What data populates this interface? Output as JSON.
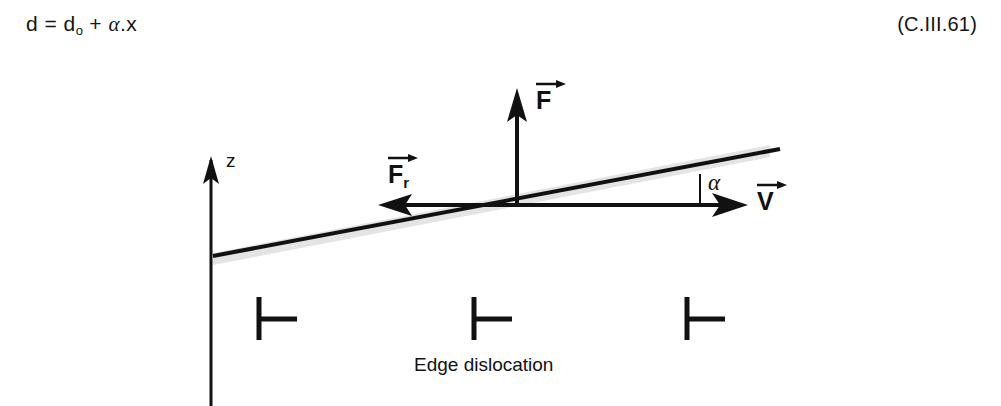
{
  "equation": {
    "text_main": "d = d",
    "subscript": "o",
    "text_after_sub": " + ",
    "alpha_symbol": "α",
    "text_tail": ".x",
    "number": "(C.III.61)"
  },
  "figure": {
    "axis": {
      "z_label": "z"
    },
    "vectors": [
      {
        "name": "force",
        "label": "F",
        "subscript": "",
        "direction": "up"
      },
      {
        "name": "friction-force",
        "label": "F",
        "subscript": "r",
        "direction": "left"
      },
      {
        "name": "velocity",
        "label": "V",
        "subscript": "",
        "direction": "right"
      }
    ],
    "angle": {
      "label": "α"
    },
    "caption": "Edge dislocation",
    "dislocation_symbol_count": 3,
    "colors": {
      "ink": "#111111",
      "band": "#e2e2e2",
      "background": "#ffffff"
    }
  }
}
